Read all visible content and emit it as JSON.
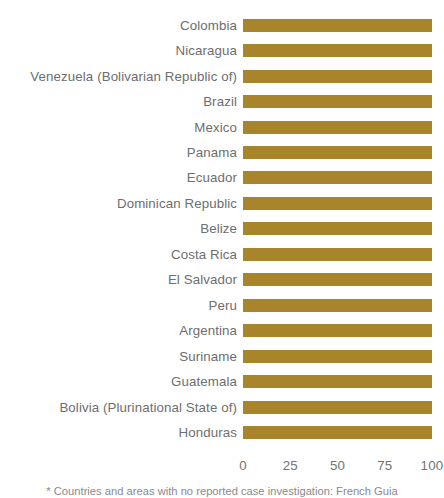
{
  "chart_data": {
    "type": "bar",
    "orientation": "horizontal",
    "title": "",
    "subtitle": "",
    "xlabel": "",
    "ylabel": "",
    "xlim": [
      0,
      100
    ],
    "xticks": [
      0,
      25,
      50,
      75,
      100
    ],
    "xtick_labels": [
      "0",
      "25",
      "50",
      "75",
      "100"
    ],
    "grid": false,
    "legend": null,
    "legend_position": "none",
    "bar_color": "#a8842a",
    "label_color": "#6e6e6e",
    "tick_color": "#737373",
    "background_color": "#ffffff",
    "categories": [
      "Colombia",
      "Nicaragua",
      "Venezuela (Bolivarian Republic of)",
      "Brazil",
      "Mexico",
      "Panama",
      "Ecuador",
      "Dominican Republic",
      "Belize",
      "Costa Rica",
      "El Salvador",
      "Peru",
      "Argentina",
      "Suriname",
      "Guatemala",
      "Bolivia (Plurinational State of)",
      "Honduras"
    ],
    "values": [
      100,
      100,
      100,
      100,
      100,
      100,
      100,
      100,
      100,
      100,
      100,
      100,
      100,
      100,
      100,
      100,
      100
    ],
    "annotations": [
      "* Countries and areas with no reported case investigation: French Guia"
    ]
  },
  "footnote": {
    "text": "* Countries and areas with no reported case investigation: French Guia"
  }
}
